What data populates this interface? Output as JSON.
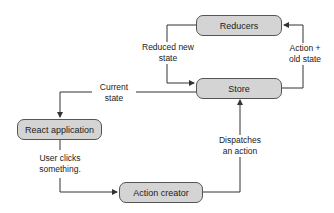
{
  "nodes": {
    "reducers": "Reducers",
    "store": "Store",
    "react_app": "React application",
    "action_creator": "Action creator"
  },
  "edges": {
    "reduced_new_state_1": "Reduced new",
    "reduced_new_state_2": "state",
    "action_old_state_1": "Action +",
    "action_old_state_2": "old state",
    "current_state_1": "Current",
    "current_state_2": "state",
    "user_clicks_1": "User clicks",
    "user_clicks_2": "something.",
    "dispatches_1": "Dispatches",
    "dispatches_2": "an action"
  }
}
